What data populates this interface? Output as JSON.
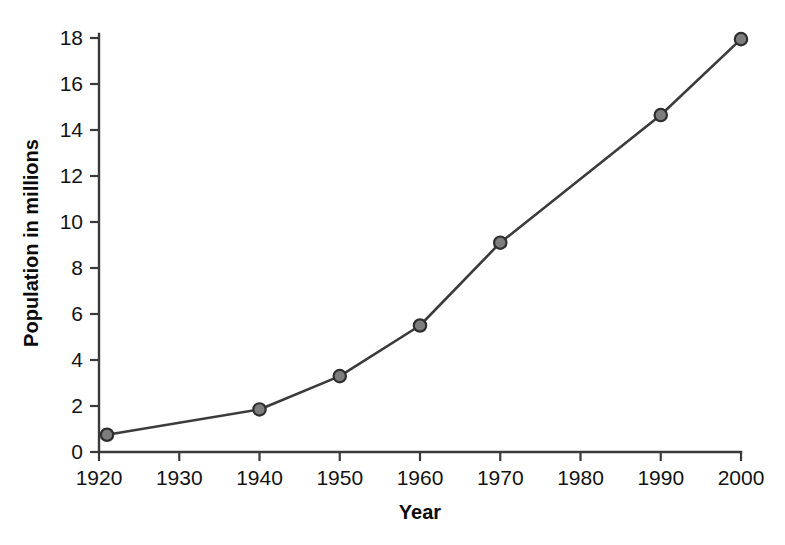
{
  "chart_data": {
    "type": "line",
    "title": "",
    "xlabel": "Year",
    "ylabel": "Population in millions",
    "xlim": [
      1920,
      2000
    ],
    "ylim": [
      0,
      18
    ],
    "grid": false,
    "legend": "none",
    "x_ticks": [
      1920,
      1930,
      1940,
      1950,
      1960,
      1970,
      1980,
      1990,
      2000
    ],
    "x_tick_labels": [
      "1920",
      "1930",
      "1940",
      "1950",
      "1960",
      "1970",
      "1980",
      "1990",
      "2000"
    ],
    "y_ticks": [
      0,
      2,
      4,
      6,
      8,
      10,
      12,
      14,
      16,
      18
    ],
    "y_tick_labels": [
      "0",
      "2",
      "4",
      "6",
      "8",
      "10",
      "12",
      "14",
      "16",
      "18"
    ],
    "series": [
      {
        "name": "Population",
        "line_color": "#3b3b3b",
        "marker_fill": "#7d7d7d",
        "marker_edge": "#2e2e2e",
        "points": [
          {
            "x": 1921,
            "y": 0.75
          },
          {
            "x": 1940,
            "y": 1.85
          },
          {
            "x": 1950,
            "y": 3.3
          },
          {
            "x": 1960,
            "y": 5.5
          },
          {
            "x": 1970,
            "y": 9.1
          },
          {
            "x": 1990,
            "y": 14.65
          },
          {
            "x": 2000,
            "y": 17.95
          }
        ]
      }
    ]
  },
  "colors": {
    "background": "#ffffff",
    "axis": "#3a3a3a",
    "text": "#131313",
    "series": "#3b3b3b",
    "marker": "#7d7d7d"
  }
}
